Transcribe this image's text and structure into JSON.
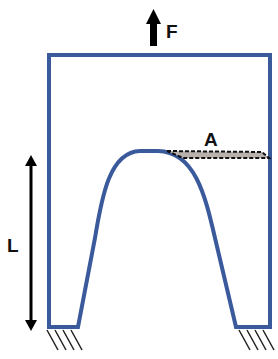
{
  "diagram": {
    "labels": {
      "force": "F",
      "area": "A",
      "length": "L"
    },
    "colors": {
      "structure": "#3a5a9c",
      "arrow": "#000000",
      "area_fill": "#b9b2ac",
      "hatch": "#222222"
    },
    "elements": [
      {
        "name": "force-arrow",
        "label": "F",
        "direction": "up"
      },
      {
        "name": "cross-section-area",
        "label": "A",
        "style": "dashed parallelogram"
      },
      {
        "name": "length-dimension",
        "label": "L",
        "style": "double-headed arrow"
      },
      {
        "name": "left-fixed-support",
        "style": "hatched ground"
      },
      {
        "name": "right-fixed-support",
        "style": "hatched ground"
      }
    ]
  }
}
